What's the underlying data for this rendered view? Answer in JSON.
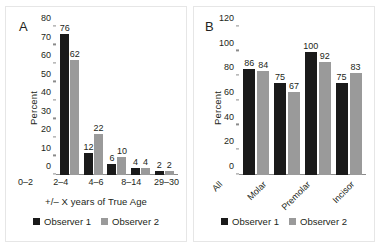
{
  "figure": {
    "background": "#ffffff",
    "series_colors": {
      "observer1": "#1a1a1a",
      "observer2": "#9a9a9a"
    }
  },
  "panels": [
    {
      "letter": "A",
      "legend": [
        {
          "label": "Observer 1",
          "color": "#1a1a1a"
        },
        {
          "label": "Observer 2",
          "color": "#9a9a9a"
        }
      ],
      "chart_data": {
        "type": "bar",
        "title": "",
        "xlabel": "+/– X years of True Age",
        "ylabel": "Percent",
        "categories": [
          "0–2",
          "2–4",
          "4–6",
          "8–14",
          "29–30"
        ],
        "series": [
          {
            "name": "Observer 1",
            "values": [
              76,
              12,
              6,
              4,
              2
            ]
          },
          {
            "name": "Observer 2",
            "values": [
              62,
              22,
              10,
              4,
              2
            ]
          }
        ],
        "ylim": [
          0,
          80
        ],
        "yticks": [
          0,
          10,
          20,
          30,
          40,
          50,
          60,
          70,
          80
        ],
        "grid": false,
        "legend_position": "bottom",
        "data_labels": true
      }
    },
    {
      "letter": "B",
      "legend": [
        {
          "label": "Observer 1",
          "color": "#1a1a1a"
        },
        {
          "label": "Observer 2",
          "color": "#9a9a9a"
        }
      ],
      "chart_data": {
        "type": "bar",
        "title": "",
        "xlabel": "",
        "ylabel": "Percent",
        "categories": [
          "All",
          "Molar",
          "Premolar",
          "Incisor"
        ],
        "series": [
          {
            "name": "Observer 1",
            "values": [
              86,
              75,
              100,
              75
            ]
          },
          {
            "name": "Observer 2",
            "values": [
              84,
              67,
              92,
              83
            ]
          }
        ],
        "ylim": [
          0,
          120
        ],
        "yticks": [
          0,
          20,
          40,
          60,
          80,
          100,
          120
        ],
        "grid": false,
        "legend_position": "bottom",
        "data_labels": true
      }
    }
  ]
}
